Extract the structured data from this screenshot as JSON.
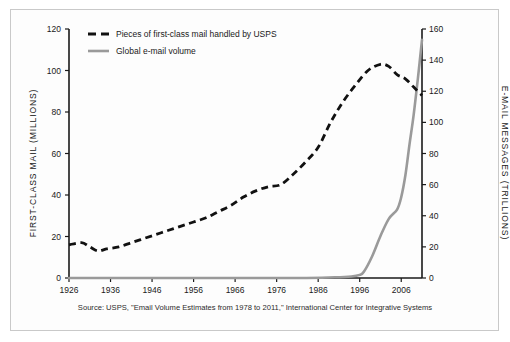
{
  "chart_data": {
    "type": "line",
    "title": "",
    "subtitle": "",
    "xlabel": "",
    "ylabel": "FIRST-CLASS MAIL (MILLIONS)",
    "y2label": "E-MAIL MESSAGES (TRILLIONS)",
    "xlim": [
      1926,
      2011
    ],
    "ylim": [
      0,
      120
    ],
    "y2lim": [
      0,
      160
    ],
    "grid": false,
    "legend_position": "top-left",
    "xticks": [
      1926,
      1936,
      1946,
      1956,
      1966,
      1976,
      1986,
      1996,
      2006
    ],
    "xtick_labels": [
      "1926",
      "1936",
      "1946",
      "1956",
      "1966",
      "1976",
      "1986",
      "1996",
      "2006"
    ],
    "yticks": [
      0,
      20,
      40,
      60,
      80,
      100,
      120
    ],
    "ytick_labels": [
      "0",
      "20",
      "40",
      "60",
      "80",
      "100",
      "120"
    ],
    "y2ticks": [
      0,
      20,
      40,
      60,
      80,
      100,
      120,
      140,
      160
    ],
    "y2tick_labels": [
      "0",
      "20",
      "40",
      "60",
      "80",
      "100",
      "120",
      "140",
      "160"
    ],
    "series": [
      {
        "name": "Pieces of first-class mail handled by USPS",
        "axis": "left",
        "style": "dashed",
        "color": "#111111",
        "x": [
          1926,
          1929,
          1931,
          1933,
          1935,
          1938,
          1941,
          1944,
          1947,
          1950,
          1953,
          1956,
          1959,
          1962,
          1965,
          1968,
          1971,
          1974,
          1977,
          1980,
          1983,
          1986,
          1989,
          1992,
          1995,
          1998,
          2001,
          2003,
          2005,
          2007,
          2009,
          2011
        ],
        "values": [
          16,
          17,
          15,
          13,
          14,
          15,
          17,
          19,
          21,
          23,
          25,
          27,
          29,
          32,
          35,
          39,
          42,
          44,
          45,
          50,
          56,
          63,
          75,
          85,
          93,
          100,
          103,
          102,
          98,
          96,
          92,
          88
        ]
      },
      {
        "name": "Global e-mail volume",
        "axis": "right",
        "style": "solid",
        "color": "#9a9a9a",
        "x": [
          1926,
          1978,
          1990,
          1994,
          1996,
          1997,
          1999,
          2001,
          2003,
          2005,
          2006,
          2007,
          2008,
          2009,
          2010,
          2011
        ],
        "values": [
          0,
          0,
          0.5,
          1,
          2,
          4,
          14,
          27,
          38,
          44,
          52,
          66,
          86,
          105,
          128,
          153
        ]
      }
    ],
    "annotations": {
      "source": "Source: USPS, \"Email Volume Estimates from 1978 to 2011,\" International Center for Integrative Systems"
    }
  },
  "legend": {
    "items": [
      {
        "label": "Pieces of first-class mail handled by USPS",
        "swatch": "dashed-black"
      },
      {
        "label": "Global e-mail volume",
        "swatch": "solid-gray"
      }
    ]
  },
  "colors": {
    "mail_line": "#111111",
    "email_line": "#9a9a9a",
    "axis": "#1a1a1a",
    "frame": "#c9c9c9",
    "background": "#fdfdfd"
  }
}
